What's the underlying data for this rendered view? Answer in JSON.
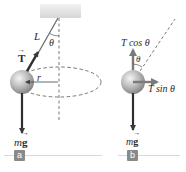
{
  "diagram": {
    "colors": {
      "arrow": "#3a3a3a",
      "string": "#6e6e6e",
      "dashed": "#555555",
      "ball_light": "#e6e6e6",
      "ball_dark": "#8c8c8c",
      "ceiling": "#e0e0e0",
      "panel_tag": "#8a8a8a",
      "panel_line": "#d8d8d8"
    },
    "panel_a": {
      "tag": "a",
      "labels": {
        "tension": "T",
        "length": "L",
        "angle": "θ",
        "radius": "r",
        "weight_m": "m",
        "weight_g": "g"
      }
    },
    "panel_b": {
      "tag": "b",
      "labels": {
        "vertical_component": "T cos θ",
        "horizontal_component": "T sin θ",
        "angle": "θ",
        "weight_m": "m",
        "weight_g": "g"
      }
    }
  }
}
